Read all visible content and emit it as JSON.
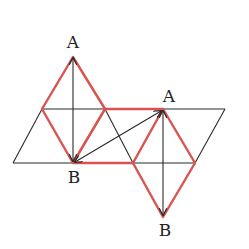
{
  "diagram": {
    "labels": [
      {
        "id": "A1",
        "text": "A",
        "x": 73,
        "y": 34
      },
      {
        "id": "B1",
        "text": "B",
        "x": 74,
        "y": 169
      },
      {
        "id": "A2",
        "text": "A",
        "x": 169,
        "y": 88
      },
      {
        "id": "B2",
        "text": "B",
        "x": 165,
        "y": 222
      }
    ],
    "colors": {
      "black_line": "#2a2a2a",
      "red_line": "#d9534f"
    },
    "points": {
      "A1": [
        73,
        57
      ],
      "B1": [
        73,
        163
      ],
      "A2": [
        163,
        110
      ],
      "B2": [
        163,
        217
      ],
      "L": [
        42,
        109
      ],
      "M": [
        105,
        109
      ],
      "N": [
        133,
        163
      ],
      "R": [
        195,
        163
      ],
      "P0": [
        13,
        163
      ],
      "P3": [
        225,
        109
      ]
    }
  }
}
